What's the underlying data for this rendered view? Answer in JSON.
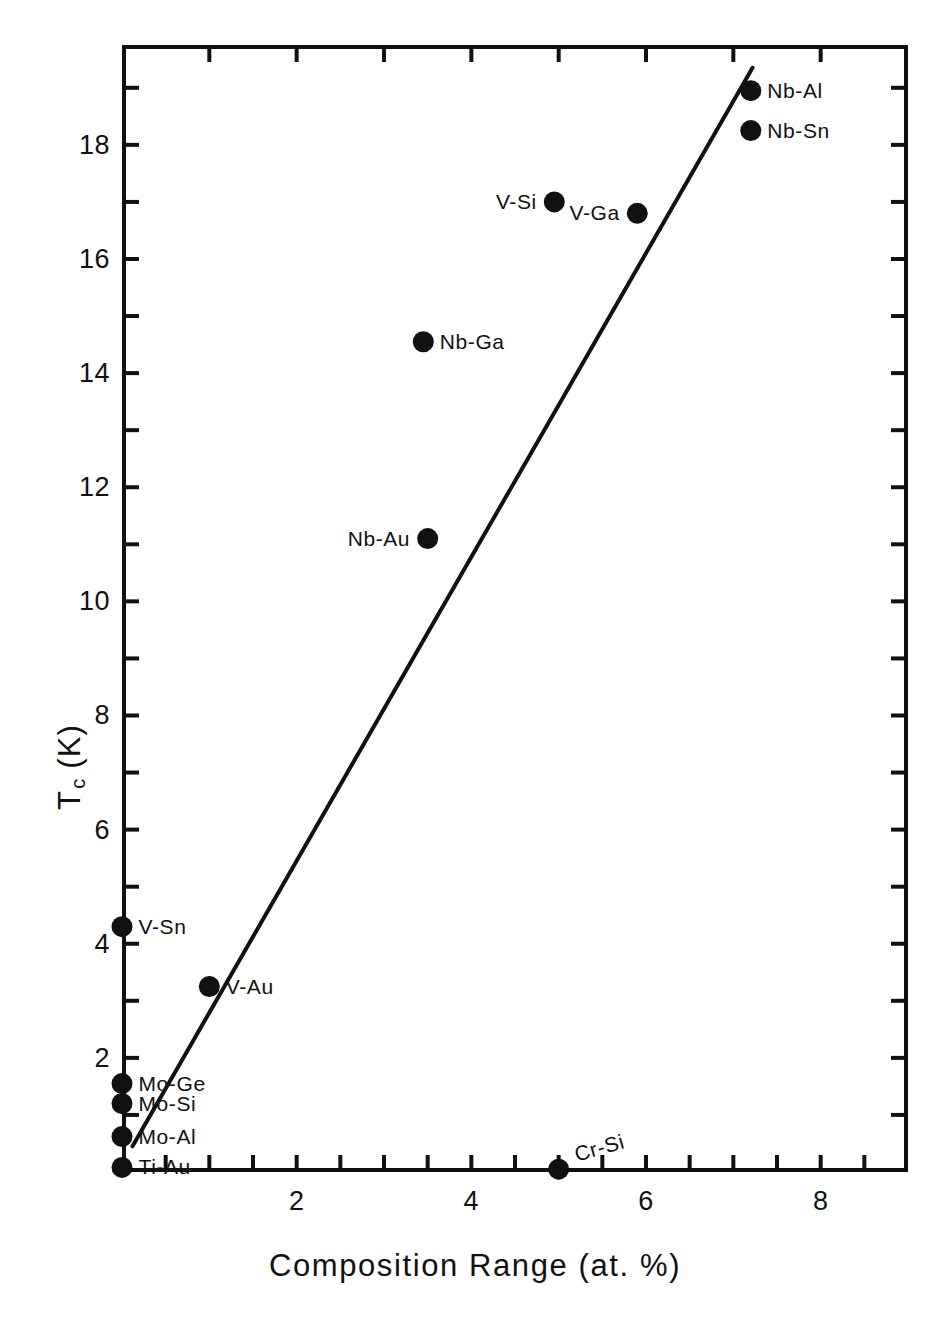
{
  "chart_data": {
    "type": "scatter",
    "title": "",
    "xlabel": "Composition Range (at. %)",
    "ylabel": "Tc (K)",
    "ylabel_main": "T",
    "ylabel_sub": "c",
    "ylabel_unit": " (K)",
    "xlim": [
      0,
      9
    ],
    "ylim": [
      0,
      19.75
    ],
    "grid": false,
    "legend": "none",
    "xticks_major": [
      2,
      4,
      6,
      8
    ],
    "xtick_labels": [
      "2",
      "4",
      "6",
      "8"
    ],
    "xticks_minor_step": 0.5,
    "yticks_major": [
      2,
      4,
      6,
      8,
      10,
      12,
      14,
      16,
      18
    ],
    "ytick_labels": [
      "2",
      "4",
      "6",
      "8",
      "10",
      "12",
      "14",
      "16",
      "18"
    ],
    "yticks_minor_step": 1,
    "marker": "filled-circle",
    "marker_color": "#111111",
    "points": [
      {
        "label": "Nb-Al",
        "x": 7.2,
        "y": 18.95,
        "label_side": "right"
      },
      {
        "label": "Nb-Sn",
        "x": 7.2,
        "y": 18.25,
        "label_side": "right"
      },
      {
        "label": "V-Si",
        "x": 4.95,
        "y": 17.0,
        "label_side": "left"
      },
      {
        "label": "V-Ga",
        "x": 5.9,
        "y": 16.8,
        "label_side": "left"
      },
      {
        "label": "Nb-Ga",
        "x": 3.45,
        "y": 14.55,
        "label_side": "right"
      },
      {
        "label": "Nb-Au",
        "x": 3.5,
        "y": 11.1,
        "label_side": "left"
      },
      {
        "label": "V-Sn",
        "x": 0.0,
        "y": 4.3,
        "label_side": "right"
      },
      {
        "label": "V-Au",
        "x": 1.0,
        "y": 3.25,
        "label_side": "right"
      },
      {
        "label": "Mo-Ge",
        "x": 0.0,
        "y": 1.55,
        "label_side": "right"
      },
      {
        "label": "Mo-Si",
        "x": 0.0,
        "y": 1.2,
        "label_side": "right"
      },
      {
        "label": "Mo-Al",
        "x": 0.0,
        "y": 0.62,
        "label_side": "right"
      },
      {
        "label": "Ti-Au",
        "x": 0.0,
        "y": 0.08,
        "label_side": "right"
      },
      {
        "label": "Cr-Si",
        "x": 5.0,
        "y": 0.05,
        "label_side": "right"
      }
    ],
    "trend_line": {
      "x0": 0.12,
      "y0": 0.45,
      "x1": 7.22,
      "y1": 19.35,
      "color": "#111111"
    }
  }
}
